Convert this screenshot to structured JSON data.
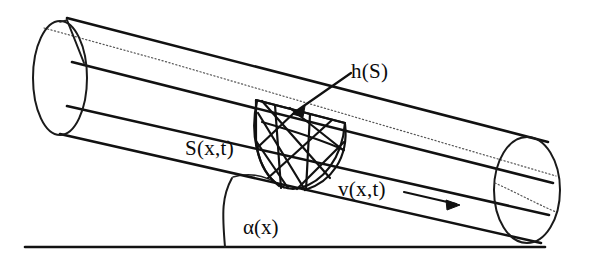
{
  "figure": {
    "kind": "inclined-cylindrical-pipe-cross-section-diagram",
    "background_color": "#ffffff",
    "line_color": "#111111",
    "dotted_line_color": "#555555"
  },
  "labels": {
    "cross_section": "S(x,t)",
    "water_depth": "h(S)",
    "velocity": "v(x,t)",
    "inclination_angle": "α(x)"
  },
  "annotations": {
    "depth_leader_description": "arrow from h(S) label down-left to hatched cross-section",
    "velocity_arrow_description": "horizontal arrow to the right of v(x,t) indicating flow direction",
    "angle_arc_description": "arc between horizontal baseline and the pipe underside marking alpha(x)"
  },
  "geometry": {
    "canvas_width": 591,
    "canvas_height": 265,
    "baseline": {
      "x1": 25,
      "y1": 247,
      "x2": 545,
      "y2": 247
    },
    "left_cap": {
      "cx": 60,
      "cy": 78,
      "rx": 27,
      "ry": 56
    },
    "right_cap": {
      "cx": 527,
      "cy": 190,
      "rx": 33,
      "ry": 53
    },
    "pipe_top_edge": {
      "x1": 67,
      "y1": 18,
      "x2": 546,
      "y2": 142
    },
    "pipe_bottom_edge": {
      "x1": 60,
      "y1": 134,
      "x2": 540,
      "y2": 243
    },
    "water_surface_line": {
      "x1": 85,
      "y1": 59,
      "x2": 555,
      "y2": 183
    },
    "wetted_bed_line": {
      "x1": 67,
      "y1": 105,
      "x2": 548,
      "y2": 215
    },
    "cross_section_center_x": 290,
    "cross_section_center_y": 140
  }
}
